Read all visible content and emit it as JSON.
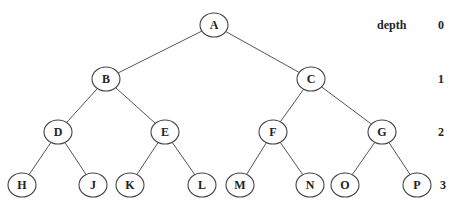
{
  "diagram": {
    "type": "binary-tree",
    "depth_header": "depth",
    "depth_levels": [
      {
        "label": "0",
        "y": 25
      },
      {
        "label": "1",
        "y": 79
      },
      {
        "label": "2",
        "y": 132
      },
      {
        "label": "3",
        "y": 185
      }
    ],
    "nodes": [
      {
        "id": "A",
        "label": "A",
        "x": 214,
        "y": 25,
        "depth": 0
      },
      {
        "id": "B",
        "label": "B",
        "x": 106,
        "y": 79,
        "depth": 1
      },
      {
        "id": "C",
        "label": "C",
        "x": 311,
        "y": 79,
        "depth": 1
      },
      {
        "id": "D",
        "label": "D",
        "x": 58,
        "y": 132,
        "depth": 2
      },
      {
        "id": "E",
        "label": "E",
        "x": 165,
        "y": 132,
        "depth": 2
      },
      {
        "id": "F",
        "label": "F",
        "x": 273,
        "y": 132,
        "depth": 2
      },
      {
        "id": "G",
        "label": "G",
        "x": 382,
        "y": 132,
        "depth": 2
      },
      {
        "id": "H",
        "label": "H",
        "x": 22,
        "y": 185,
        "depth": 3
      },
      {
        "id": "J",
        "label": "J",
        "x": 93,
        "y": 185,
        "depth": 3
      },
      {
        "id": "K",
        "label": "K",
        "x": 130,
        "y": 185,
        "depth": 3
      },
      {
        "id": "L",
        "label": "L",
        "x": 202,
        "y": 185,
        "depth": 3
      },
      {
        "id": "M",
        "label": "M",
        "x": 240,
        "y": 185,
        "depth": 3
      },
      {
        "id": "N",
        "label": "N",
        "x": 310,
        "y": 185,
        "depth": 3
      },
      {
        "id": "O",
        "label": "O",
        "x": 345,
        "y": 185,
        "depth": 3
      },
      {
        "id": "P",
        "label": "P",
        "x": 417,
        "y": 185,
        "depth": 3
      }
    ],
    "edges": [
      [
        "A",
        "B"
      ],
      [
        "A",
        "C"
      ],
      [
        "B",
        "D"
      ],
      [
        "B",
        "E"
      ],
      [
        "C",
        "F"
      ],
      [
        "C",
        "G"
      ],
      [
        "D",
        "H"
      ],
      [
        "D",
        "J"
      ],
      [
        "E",
        "K"
      ],
      [
        "E",
        "L"
      ],
      [
        "F",
        "M"
      ],
      [
        "F",
        "N"
      ],
      [
        "G",
        "O"
      ],
      [
        "G",
        "P"
      ]
    ]
  }
}
